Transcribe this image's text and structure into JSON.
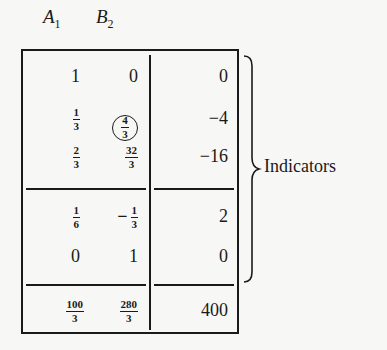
{
  "table": {
    "headers": [
      {
        "base": "A",
        "sub": "1"
      },
      {
        "base": "B",
        "sub": "2"
      }
    ],
    "rows": [
      {
        "a": {
          "type": "int",
          "value": "1"
        },
        "b": {
          "type": "int",
          "value": "0"
        },
        "rhs": "0"
      },
      {
        "a": {
          "type": "frac",
          "num": "1",
          "den": "3"
        },
        "b": {
          "type": "frac",
          "num": "4",
          "den": "3",
          "circled": true
        },
        "rhs": "−4"
      },
      {
        "a": {
          "type": "frac",
          "num": "2",
          "den": "3"
        },
        "b": {
          "type": "frac",
          "num": "32",
          "den": "3"
        },
        "rhs": "−16"
      },
      {
        "a": {
          "type": "frac",
          "num": "1",
          "den": "6"
        },
        "b": {
          "type": "frac",
          "num": "1",
          "den": "3",
          "negative": true
        },
        "rhs": "2"
      },
      {
        "a": {
          "type": "int",
          "value": "0"
        },
        "b": {
          "type": "int",
          "value": "1"
        },
        "rhs": "0"
      },
      {
        "a": {
          "type": "frac",
          "num": "100",
          "den": "3"
        },
        "b": {
          "type": "frac",
          "num": "280",
          "den": "3"
        },
        "rhs": "400"
      }
    ],
    "neg_sign": "−"
  },
  "annotation": {
    "label": "Indicators"
  }
}
